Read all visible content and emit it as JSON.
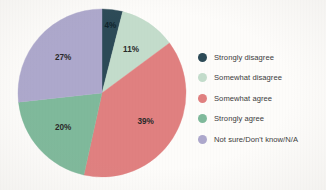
{
  "chart_data": {
    "type": "pie",
    "title": "",
    "subtitle": "",
    "xlabel": "",
    "ylabel": "",
    "legend_position": "right",
    "grid": false,
    "start_angle_deg": 0,
    "direction": "clockwise",
    "categories": [
      "Strongly disagree",
      "Somewhat disagree",
      "Somewhat agree",
      "Strongly agree",
      "Not sure/Don't know/N/A"
    ],
    "values": [
      4,
      11,
      39,
      20,
      27
    ],
    "value_labels": [
      "4%",
      "11%",
      "39%",
      "20%",
      "27%"
    ],
    "colors": [
      "#2c4a57",
      "#c3dccb",
      "#e08080",
      "#7fb99b",
      "#ada8cc"
    ],
    "slices": [
      {
        "label": "Strongly disagree",
        "value": 4,
        "value_label": "4%",
        "color": "#2c4a57"
      },
      {
        "label": "Somewhat disagree",
        "value": 11,
        "value_label": "11%",
        "color": "#c3dccb"
      },
      {
        "label": "Somewhat agree",
        "value": 39,
        "value_label": "39%",
        "color": "#e08080"
      },
      {
        "label": "Strongly agree",
        "value": 20,
        "value_label": "20%",
        "color": "#7fb99b"
      },
      {
        "label": "Not sure/Don't know/N/A",
        "value": 27,
        "value_label": "27%",
        "color": "#ada8cc"
      }
    ]
  },
  "legend": {
    "items": [
      {
        "label": "Strongly disagree",
        "color": "#2c4a57"
      },
      {
        "label": "Somewhat disagree",
        "color": "#c3dccb"
      },
      {
        "label": "Somewhat agree",
        "color": "#e08080"
      },
      {
        "label": "Strongly agree",
        "color": "#7fb99b"
      },
      {
        "label": "Not sure/Don't know/N/A",
        "color": "#ada8cc"
      }
    ]
  },
  "theme": {
    "background": "#fdfcfa",
    "label_color": "#2a2a2a",
    "legend_text_color": "#3b3b3b"
  }
}
